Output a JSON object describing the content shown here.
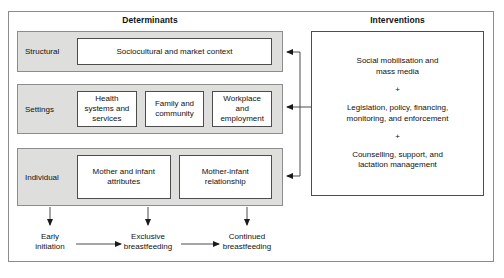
{
  "figure": {
    "columns": {
      "determinants_heading": "Determinants",
      "interventions_heading": "Interventions"
    },
    "determinants": {
      "rows": [
        {
          "label": "Structural",
          "boxes": [
            {
              "text": "Sociocultural and market context"
            }
          ]
        },
        {
          "label": "Settings",
          "boxes": [
            {
              "text": "Health systems and services"
            },
            {
              "text": "Family and community"
            },
            {
              "text": "Workplace and employment"
            }
          ]
        },
        {
          "label": "Individual",
          "boxes": [
            {
              "text": "Mother and infant attributes"
            },
            {
              "text": "Mother-infant relationship"
            }
          ]
        }
      ]
    },
    "interventions": {
      "items": [
        "Social mobilisation and\nmass media",
        "Legislation, policy, financing,\nmonitoring, and enforcement",
        "Counselling, support, and\nlactation management"
      ],
      "separator": "+"
    },
    "outcomes": [
      "Early\ninitiation",
      "Exclusive\nbreastfeeding",
      "Continued\nbreastfeeding"
    ],
    "colors": {
      "band_fill": "#dededd",
      "box_fill": "#ffffff",
      "line": "#4d4d4d",
      "frame": "#8c8c8c",
      "text": "#111111"
    }
  }
}
